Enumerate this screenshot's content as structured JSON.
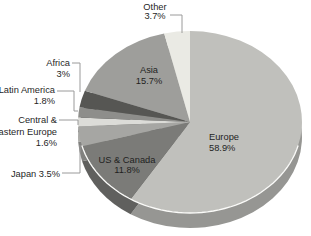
{
  "figure": {
    "width": 311,
    "height": 236,
    "background": "#ffffff"
  },
  "chart_data": {
    "type": "pie",
    "title": "",
    "unit": "%",
    "direction": "clockwise",
    "start_angle_deg": 0,
    "style": "3d-ellipse",
    "legend": "none",
    "text_color": "#1f1f1f",
    "leader_line_color": "#9a9a9a",
    "highlight_arc_color": "#fbfbf9",
    "geometry": {
      "cx": 190,
      "cy": 122,
      "rx": 112,
      "ry": 91,
      "depth": 15,
      "depth_darken": 0.78,
      "highlight_from_deg": 105,
      "highlight_to_deg": 255
    },
    "slices": [
      {
        "name": "europe",
        "label": "Europe",
        "pct": 58.9,
        "color": "#c0c0bc",
        "label_lines": [
          "Europe",
          "58.9%"
        ],
        "label_layout": {
          "x": 209,
          "y": 140,
          "align": "start",
          "lh": 11
        }
      },
      {
        "name": "us-canada",
        "label": "US & Canada",
        "pct": 11.8,
        "color": "#7b7b78",
        "label_lines": [
          "US & Canada",
          "11.8%"
        ],
        "label_layout": {
          "x": 127,
          "y": 163,
          "align": "middle",
          "lh": 10
        }
      },
      {
        "name": "japan",
        "label": "Japan",
        "pct": 3.5,
        "color": "#a6a6a3",
        "label_lines": [
          "Japan 3.5%"
        ],
        "label_layout": {
          "x": 60,
          "y": 177,
          "align": "end",
          "lh": 10
        },
        "leader": [
          [
            62,
            173
          ],
          [
            80,
            173
          ],
          [
            80,
            145
          ]
        ]
      },
      {
        "name": "central-eastern-europe",
        "label": "Central & Eastern Europe",
        "pct": 1.6,
        "color": "#dcdcd8",
        "label_lines": [
          "Central &",
          "Eastern Europe",
          "1.6%"
        ],
        "label_layout": {
          "x": 57,
          "y": 123,
          "align": "end",
          "lh": 11.5
        },
        "leader": [
          [
            59,
            120
          ],
          [
            78,
            120
          ],
          [
            78,
            125
          ]
        ]
      },
      {
        "name": "latin-america",
        "label": "Latin America",
        "pct": 1.8,
        "color": "#8e8e8b",
        "label_lines": [
          "Latin America",
          "1.8%"
        ],
        "label_layout": {
          "x": 55,
          "y": 93,
          "align": "end",
          "lh": 10.5
        },
        "leader": [
          [
            57,
            91
          ],
          [
            74,
            91
          ],
          [
            74,
            111
          ],
          [
            78,
            111
          ]
        ]
      },
      {
        "name": "africa",
        "label": "Africa",
        "pct": 3,
        "color": "#565653",
        "label_lines": [
          "Africa",
          "3%"
        ],
        "label_layout": {
          "x": 70,
          "y": 66,
          "align": "end",
          "lh": 10.5
        },
        "leader": [
          [
            72,
            63
          ],
          [
            80,
            63
          ],
          [
            80,
            92
          ]
        ]
      },
      {
        "name": "asia",
        "label": "Asia",
        "pct": 15.7,
        "color": "#9e9e9b",
        "label_lines": [
          "Asia",
          "15.7%"
        ],
        "label_layout": {
          "x": 149,
          "y": 73,
          "align": "middle",
          "lh": 11
        }
      },
      {
        "name": "other",
        "label": "Other",
        "pct": 3.7,
        "color": "#eaeae4",
        "label_lines": [
          "Other",
          "3.7%"
        ],
        "label_layout": {
          "x": 155,
          "y": 10,
          "align": "middle",
          "lh": 9
        },
        "leader": [
          [
            170,
            15
          ],
          [
            182,
            15
          ],
          [
            182,
            33
          ]
        ]
      }
    ]
  }
}
